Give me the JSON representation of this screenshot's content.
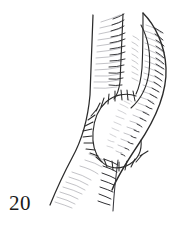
{
  "figure": {
    "number_label": "20",
    "caption": "",
    "ink_color": "#2b2b2b",
    "light_ink_color": "#8d8d93",
    "background_color": "#ffffff",
    "width": 188,
    "height": 229
  },
  "drawing": {
    "elements": [
      {
        "name": "left-limb-contour",
        "type": "stroke",
        "description": "long near-vertical outer contour of the limb running from top to lower left"
      },
      {
        "name": "inner-limb-contour",
        "type": "stroke",
        "description": "second vertical contour inboard of the left edge, descending to the suture field"
      },
      {
        "name": "upper-fold-contour",
        "type": "stroke",
        "description": "vertical crease line at the top center rising to the apex vertex"
      },
      {
        "name": "right-lobe-outer-contour",
        "type": "stroke",
        "description": "large curved outer edge of the folded lobe on the right, bulging out and tapering to the lower center"
      },
      {
        "name": "right-lobe-inner-contour",
        "type": "stroke",
        "description": "inner curve of the folded lobe forming a narrow slit against the limb"
      },
      {
        "name": "suture-line",
        "type": "stroke",
        "description": "closed teardrop-shaped incision line closed with interrupted sutures"
      },
      {
        "name": "suture-stitches",
        "type": "ticks",
        "description": "short transverse stitch marks crossing the suture line at regular intervals"
      },
      {
        "name": "upper-hatching",
        "type": "hatching",
        "description": "curved shading strokes along the upper limb and lobe"
      },
      {
        "name": "lobe-hatching",
        "type": "hatching",
        "description": "dense curved shading strokes following the contour of the right lobe"
      },
      {
        "name": "lower-hatching",
        "type": "hatching",
        "description": "shading strokes on the lower tapering limb"
      },
      {
        "name": "flap-hatching",
        "type": "hatching",
        "description": "short shading strokes radiating inside the sutured flap"
      }
    ]
  }
}
